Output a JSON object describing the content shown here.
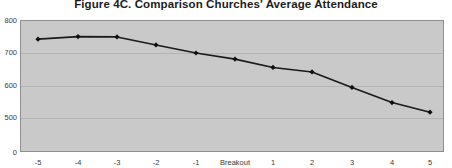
{
  "chart_data": {
    "type": "line",
    "title": "Figure 4C. Comparison Churches' Average Attendance",
    "xlabel": "",
    "ylabel": "",
    "categories": [
      "-5",
      "-4",
      "-3",
      "-2",
      "-1",
      "Breakout",
      "1",
      "2",
      "3",
      "4",
      "5"
    ],
    "values": [
      742,
      750,
      749,
      724,
      699,
      680,
      654,
      640,
      592,
      545,
      515
    ],
    "series": [
      {
        "name": "Comparison Churches' Average Attendance",
        "values": [
          742,
          750,
          749,
          724,
          699,
          680,
          654,
          640,
          592,
          545,
          515
        ]
      }
    ],
    "yticks": [
      0,
      500,
      600,
      700,
      800
    ],
    "ytick_labels": [
      "0",
      "500",
      "600",
      "700",
      "800"
    ],
    "ylim": [
      0,
      800
    ],
    "axis_break": true,
    "axis_break_note": "y-axis compressed between 0 and 500",
    "grid": true,
    "legend": "none",
    "marker": "diamond",
    "line_color": "#1a1a1a",
    "marker_color": "#101010",
    "plot_background": "#c9c9c9",
    "figure_background": "#ffffff",
    "grid_color": "#b4b4b4",
    "axis_text_color": "#3a3a3a",
    "title_color": "#1c1c1c"
  }
}
